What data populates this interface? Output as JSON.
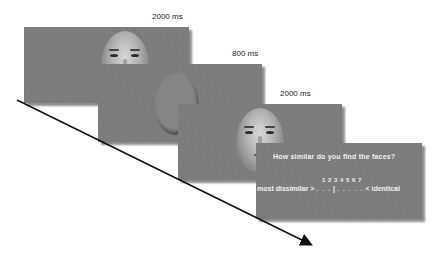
{
  "frames": [
    {
      "id": 1,
      "label": "2000 ms",
      "content": "face"
    },
    {
      "id": 2,
      "label": "800 ms",
      "content": "mask"
    },
    {
      "id": 3,
      "label": "2000 ms",
      "content": "face"
    },
    {
      "id": 4,
      "label": "",
      "content": "rating"
    }
  ],
  "rating": {
    "question": "How similar do you find the faces?",
    "scale_numbers": "1 2 3 4 5 6 7",
    "left_anchor": "most dissimilar >",
    "right_anchor": "< identical",
    "left_dots": ". . .",
    "cursor": "|",
    "right_dots": ". . . . ."
  },
  "colors": {
    "panel": "#7b7b7b",
    "arrow": "#111111"
  }
}
